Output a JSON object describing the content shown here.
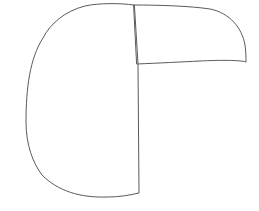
{
  "canvas": {
    "width": 259,
    "height": 211,
    "background": "#ffffff"
  },
  "style": {
    "stroke": "#5a5a5a"
  },
  "shapes": [
    {
      "name": "left-half-disc",
      "d": "M 134 5 C 120 3, 98 3, 85 6 C 65 11, 50 24, 43 38 C 30 58, 26 88, 26 122 C 26 145, 33 163, 42 175 C 58 191, 80 198, 108 197 C 120 197, 130 195, 139 193 L 138 64 Z"
    },
    {
      "name": "upper-right-wedge",
      "d": "M 134 5 C 160 5, 190 6, 210 9 C 230 13, 242 28, 245 45 C 246 52, 246 58, 246 62 C 240 60, 220 60, 200 61 C 180 62, 160 63, 137 64 Z"
    }
  ]
}
